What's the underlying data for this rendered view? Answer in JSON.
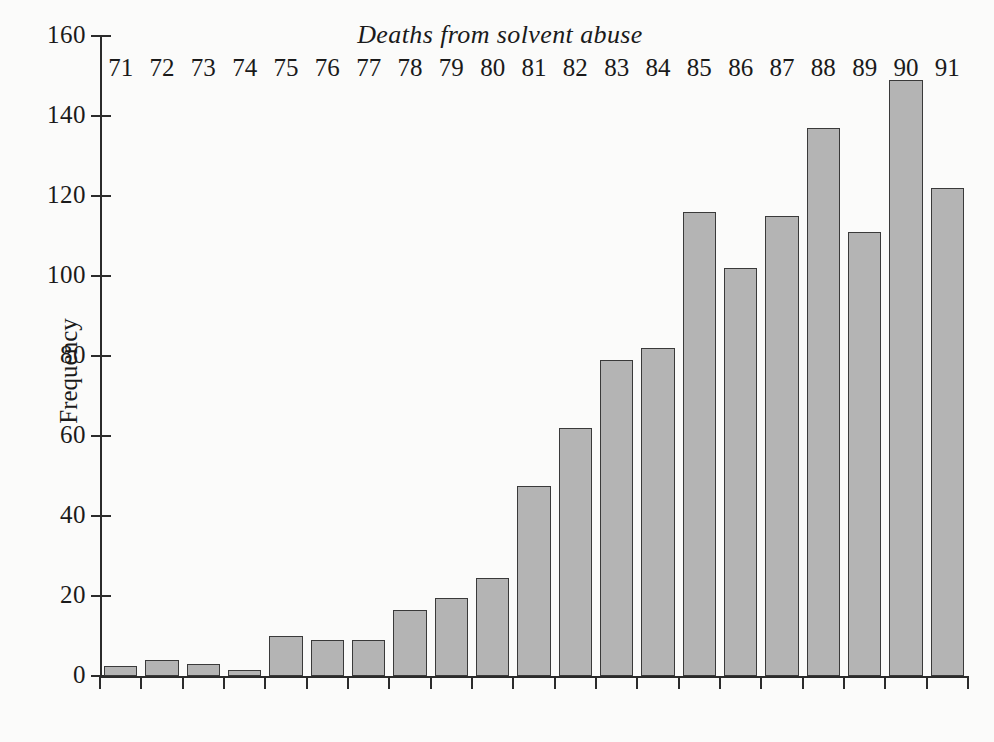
{
  "chart_data": {
    "type": "bar",
    "title": "Deaths from solvent abuse",
    "xlabel": "",
    "ylabel": "Frequency",
    "categories": [
      "71",
      "72",
      "73",
      "74",
      "75",
      "76",
      "77",
      "78",
      "79",
      "80",
      "81",
      "82",
      "83",
      "84",
      "85",
      "86",
      "87",
      "88",
      "89",
      "90",
      "91"
    ],
    "values": [
      2.5,
      4,
      3,
      1.5,
      10,
      9,
      9,
      16.5,
      19.5,
      24.5,
      47.5,
      62,
      79,
      82,
      116,
      102,
      115,
      137,
      111,
      149,
      122
    ],
    "ylim": [
      0,
      160
    ],
    "yticks": [
      0,
      20,
      40,
      60,
      80,
      100,
      120,
      140,
      160
    ],
    "ytick_labels": [
      "0",
      "20",
      "40",
      "60",
      "80",
      "100",
      "120",
      "140",
      "160"
    ],
    "grid": false,
    "legend": "none",
    "bar_fill": "#b4b4b4",
    "bar_edge": "#3a3a3a",
    "background": "#fbfbfa"
  },
  "figure": {
    "title": "Deaths from solvent abuse",
    "y_axis_title": "Frequency",
    "page_footer": ""
  }
}
